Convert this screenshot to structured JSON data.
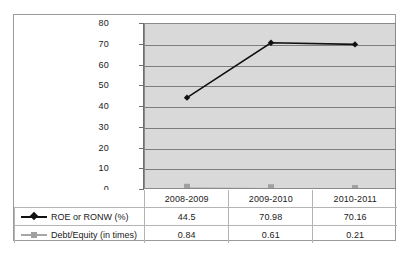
{
  "chart_data": {
    "type": "line",
    "title": "",
    "xlabel": "",
    "ylabel": "",
    "categories": [
      "2008-2009",
      "2009-2010",
      "2010-2011"
    ],
    "ylim": [
      0,
      80
    ],
    "yticks": [
      0,
      10,
      20,
      30,
      40,
      50,
      60,
      70,
      80
    ],
    "ytick_labels": [
      "0",
      "10",
      "20",
      "30",
      "40",
      "50",
      "60",
      "70",
      "80"
    ],
    "grid": true,
    "legend_position": "data-table",
    "series": [
      {
        "name": "ROE or RONW (%)",
        "values": [
          44.5,
          70.98,
          70.16
        ],
        "value_labels": [
          "44.5",
          "70.98",
          "70.16"
        ],
        "color": "#111111",
        "marker": "diamond"
      },
      {
        "name": "Debt/Equity (in times)",
        "values": [
          0.84,
          0.61,
          0.21
        ],
        "value_labels": [
          "0.84",
          "0.61",
          "0.21"
        ],
        "color": "#a0a0a0",
        "marker": "square"
      }
    ]
  },
  "colors": {
    "plot_background": "#d9d9d9",
    "gridline": "#7d7d7d",
    "frame_border": "#9a9a9a",
    "table_border": "#b4b4b4",
    "series_1": "#111111",
    "series_2": "#a0a0a0",
    "text": "#1a1a1a"
  },
  "table": {
    "corner_label": "",
    "column_headers": [
      "2008-2009",
      "2009-2010",
      "2010-2011"
    ],
    "rows": [
      {
        "legend_label": "ROE or RONW (%)",
        "marker": "diamond-icon",
        "values": [
          "44.5",
          "70.98",
          "70.16"
        ]
      },
      {
        "legend_label": "Debt/Equity (in times)",
        "marker": "square-icon",
        "values": [
          "0.84",
          "0.61",
          "0.21"
        ]
      }
    ]
  },
  "axis": {
    "y_labels": [
      "80",
      "70",
      "60",
      "50",
      "40",
      "30",
      "20",
      "10",
      "0"
    ]
  }
}
